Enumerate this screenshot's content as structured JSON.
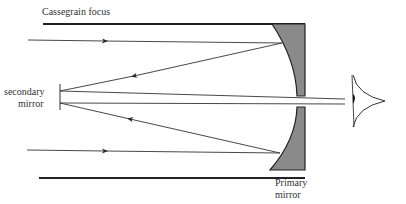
{
  "diagram": {
    "labels": {
      "focus": "Cassegrain focus",
      "secondary_line1": "secondary",
      "secondary_line2": "mirror",
      "primary_line1": "Primary",
      "primary_line2": "mirror"
    },
    "colors": {
      "mirror_fill": "#8a8a8a",
      "line": "#333333",
      "tube": "#222222"
    }
  }
}
